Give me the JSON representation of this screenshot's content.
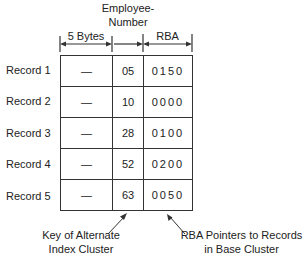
{
  "headers": {
    "col1": "5 Bytes",
    "col2": "Employee-\nNumber",
    "col2_line1": "Employee-",
    "col2_line2": "Number",
    "col3": "RBA"
  },
  "rows": [
    {
      "label": "Record 1",
      "key_prefix": "—",
      "employee_number": "05",
      "rba": "0150"
    },
    {
      "label": "Record 2",
      "key_prefix": "—",
      "employee_number": "10",
      "rba": "0000"
    },
    {
      "label": "Record 3",
      "key_prefix": "—",
      "employee_number": "28",
      "rba": "0100"
    },
    {
      "label": "Record 4",
      "key_prefix": "—",
      "employee_number": "52",
      "rba": "0200"
    },
    {
      "label": "Record 5",
      "key_prefix": "—",
      "employee_number": "63",
      "rba": "0050"
    }
  ],
  "annotations": {
    "left_line1": "Key of Alternate",
    "left_line2": "Index Cluster",
    "right_line1": "RBA Pointers to Records",
    "right_line2": "in Base Cluster"
  },
  "colors": {
    "line": "#333333",
    "text": "#222222",
    "background": "#ffffff"
  }
}
